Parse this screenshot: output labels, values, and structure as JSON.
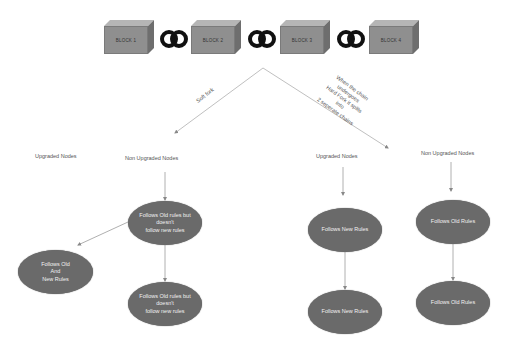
{
  "chain": {
    "blocks": [
      {
        "label": "BLOCK 1"
      },
      {
        "label": "BLOCK 2"
      },
      {
        "label": "BLOCK 3"
      },
      {
        "label": "BLOCK 4"
      }
    ],
    "link_icon": "chain-link-icon"
  },
  "forks": {
    "soft_fork_label": "Soft fork",
    "hard_fork_label": "When the chain\nundergoes\nHard Fork it splits\ninto\n2 seperate chains"
  },
  "soft_fork": {
    "upgraded_nodes_label": "Upgraded Nodes",
    "non_upgraded_nodes_label": "Non Upgraded Nodes",
    "top_node": "Follows Old rules but\ndoesn't\nfollow new rules",
    "left_node": "Follows Old\nAnd\nNew Rules",
    "bottom_node": "Follows Old rules but\ndoesn't\nfollow new rules"
  },
  "hard_fork": {
    "upgraded_nodes_label": "Upgraded Nodes",
    "non_upgraded_nodes_label": "Non Upgraded Nodes",
    "upgraded_top": "Follows New Rules",
    "upgraded_bottom": "Follows New Rules",
    "non_upgraded_top": "Follows Old Rules",
    "non_upgraded_bottom": "Follows Old Rules"
  },
  "colors": {
    "block_face": "#8f8f8f",
    "ellipse_fill": "#6a6a6a",
    "line": "#b0b0b0",
    "text": "#555555"
  }
}
